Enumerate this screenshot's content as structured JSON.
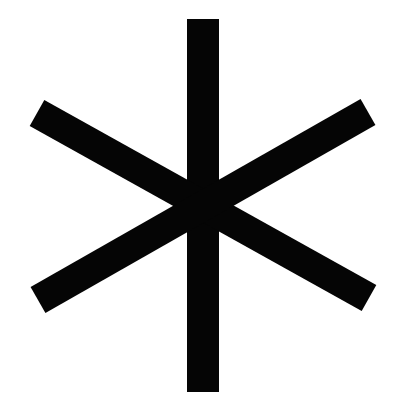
{
  "figure": {
    "subject": "six-pointed asterisk symbol",
    "icon": "asterisk-icon",
    "colors": {
      "background": "#ffffff",
      "stroke": "#050505"
    },
    "strokes": [
      {
        "name": "vertical-bar",
        "x1": 203,
        "y1": 19,
        "x2": 203,
        "y2": 392,
        "width": 32
      },
      {
        "name": "diagonal-bar-descending",
        "x1": 37,
        "y1": 113,
        "x2": 369,
        "y2": 298,
        "width": 30
      },
      {
        "name": "diagonal-bar-ascending",
        "x1": 38,
        "y1": 300,
        "x2": 368,
        "y2": 112,
        "width": 30
      }
    ]
  }
}
